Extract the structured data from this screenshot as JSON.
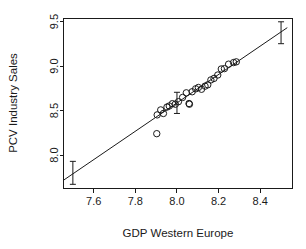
{
  "chart_data": {
    "type": "scatter",
    "title": "",
    "subtitle": "",
    "xlabel": "GDP Western Europe",
    "ylabel": "PCV Industry Sales",
    "xlim": [
      7.455,
      8.555
    ],
    "ylim": [
      7.625,
      9.535
    ],
    "xticks": [
      7.6,
      7.8,
      8.0,
      8.2,
      8.4
    ],
    "xticklabels": [
      "7.6",
      "7.8",
      "8.0",
      "8.2",
      "8.4"
    ],
    "yticks": [
      8.0,
      8.5,
      9.0,
      9.5
    ],
    "yticklabels": [
      "8.0",
      "8.5",
      "9.0",
      "9.5"
    ],
    "grid": false,
    "legend": null,
    "box": true,
    "marker": "open-circle",
    "points": [
      {
        "x": 7.903,
        "y": 8.241
      },
      {
        "x": 7.905,
        "y": 8.452
      },
      {
        "x": 7.922,
        "y": 8.508
      },
      {
        "x": 7.935,
        "y": 8.468
      },
      {
        "x": 7.952,
        "y": 8.54
      },
      {
        "x": 7.963,
        "y": 8.552
      },
      {
        "x": 7.978,
        "y": 8.578
      },
      {
        "x": 7.992,
        "y": 8.572
      },
      {
        "x": 8.007,
        "y": 8.6
      },
      {
        "x": 8.027,
        "y": 8.648
      },
      {
        "x": 8.045,
        "y": 8.7
      },
      {
        "x": 8.058,
        "y": 8.58
      },
      {
        "x": 8.06,
        "y": 8.572
      },
      {
        "x": 8.073,
        "y": 8.712
      },
      {
        "x": 8.09,
        "y": 8.745
      },
      {
        "x": 8.103,
        "y": 8.76
      },
      {
        "x": 8.118,
        "y": 8.74
      },
      {
        "x": 8.135,
        "y": 8.775
      },
      {
        "x": 8.148,
        "y": 8.79
      },
      {
        "x": 8.163,
        "y": 8.845
      },
      {
        "x": 8.178,
        "y": 8.862
      },
      {
        "x": 8.196,
        "y": 8.9
      },
      {
        "x": 8.213,
        "y": 8.968
      },
      {
        "x": 8.228,
        "y": 8.972
      },
      {
        "x": 8.248,
        "y": 9.022
      },
      {
        "x": 8.272,
        "y": 9.04
      },
      {
        "x": 8.285,
        "y": 9.048
      }
    ],
    "fit_line": {
      "name": "regression-line",
      "x_start": 7.455,
      "y_start": 7.718,
      "x_end": 8.53,
      "y_end": 9.432
    },
    "error_bars": [
      {
        "x": 7.5,
        "y": 7.772,
        "lower": 7.672,
        "upper": 7.93
      },
      {
        "x": 8.0,
        "y": 8.592,
        "lower": 8.468,
        "upper": 8.706
      },
      {
        "x": 8.5,
        "y": 9.378,
        "lower": 9.252,
        "upper": 9.498
      }
    ]
  },
  "figure": {
    "background_color": "#ffffff",
    "foreground_color": "#1a1a1a"
  }
}
